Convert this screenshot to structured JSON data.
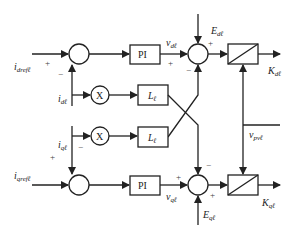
{
  "diagram": {
    "type": "control-block-diagram",
    "inputs": {
      "idref": {
        "main": "i",
        "sub": "drefℓ"
      },
      "iqref": {
        "main": "i",
        "sub": "qrefℓ"
      },
      "id": {
        "main": "i",
        "sub": "dℓ"
      },
      "iq": {
        "main": "i",
        "sub": "qℓ"
      },
      "Ed": {
        "main": "E",
        "sub": "dℓ"
      },
      "Eq": {
        "main": "E",
        "sub": "qℓ"
      },
      "vpv": {
        "main": "v",
        "sub": "pvℓ"
      }
    },
    "signals": {
      "vd": {
        "main": "v",
        "sub": "dℓ"
      },
      "vq": {
        "main": "v",
        "sub": "qℓ"
      }
    },
    "outputs": {
      "Kd": {
        "main": "K",
        "sub": "dℓ"
      },
      "Kq": {
        "main": "K",
        "sub": "qℓ"
      }
    },
    "blocks": {
      "pi_top": "PI",
      "pi_bottom": "PI",
      "mult_top": "X",
      "mult_bottom": "X",
      "L_top": {
        "main": "L",
        "sub": "ℓ"
      },
      "L_bottom": {
        "main": "L",
        "sub": "ℓ"
      }
    },
    "signs": {
      "sum1_ref": "+",
      "sum1_fb": "−",
      "sum2_pi": "+",
      "sum2_E": "+",
      "sum2_cross": "−",
      "sum3_fb": "+",
      "sum3_iq": "−",
      "sum4_pi": "+",
      "sum4_cross": "−",
      "sum4_E": "+"
    }
  }
}
